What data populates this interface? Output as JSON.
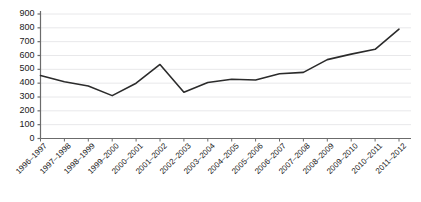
{
  "chart_data": {
    "type": "line",
    "title": "",
    "xlabel": "",
    "ylabel": "",
    "categories": [
      "1996–1997",
      "1997–1998",
      "1998–1999",
      "1999–2000",
      "2000–2001",
      "2001–2002",
      "2002–2003",
      "2003–2004",
      "2004–2005",
      "2005–2006",
      "2006–2007",
      "2007–2008",
      "2008–2009",
      "2009–2010",
      "2010–2011",
      "2011–2012"
    ],
    "values": [
      455,
      410,
      380,
      310,
      400,
      535,
      335,
      405,
      428,
      423,
      468,
      478,
      570,
      610,
      645,
      790
    ],
    "ylim": [
      0,
      900
    ],
    "ytick_values": [
      0,
      100,
      200,
      300,
      400,
      500,
      600,
      700,
      800,
      900
    ],
    "ytick_labels": [
      "0",
      "100",
      "200",
      "300",
      "400",
      "500",
      "600",
      "700",
      "800",
      "900"
    ],
    "grid": true,
    "grid_axis": "y",
    "legend": false,
    "legend_position": "none",
    "series_color": "#2b2b2b",
    "grid_color": "#e8e8ea",
    "axis_color": "#6b6b6b",
    "text_color": "#1a1a1a",
    "background_color": "#ffffff",
    "xtick_label_rotation": -45
  }
}
